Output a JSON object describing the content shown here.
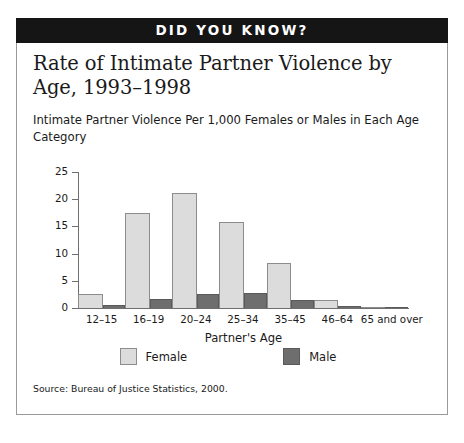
{
  "banner": {
    "label": "DID YOU KNOW?"
  },
  "title": "Rate of Intimate Partner Violence by Age, 1993–1998",
  "subtitle": "Intimate Partner Violence Per 1,000 Females or Males in Each Age Category",
  "source": "Source:  Bureau of Justice Statistics, 2000.",
  "legend": [
    {
      "label": "Female",
      "color": "#dcdcdc"
    },
    {
      "label": "Male",
      "color": "#6e6e6e"
    }
  ],
  "colors": {
    "female": "#dcdcdc",
    "male": "#6e6e6e",
    "banner_bg": "#151515",
    "banner_fg": "#ffffff",
    "axis": "#6f6f6f",
    "frame": "#9a9a9a",
    "text": "#1a1a1a"
  },
  "chart_data": {
    "type": "bar",
    "title": "Rate of Intimate Partner Violence by Age, 1993–1998",
    "subtitle": "Intimate Partner Violence Per 1,000 Females or Males in Each Age Category",
    "xlabel": "Partner's Age",
    "ylabel": "",
    "categories": [
      "12–15",
      "16–19",
      "20–24",
      "25–34",
      "35–45",
      "46–64",
      "65 and over"
    ],
    "series": [
      {
        "name": "Female",
        "color": "#dcdcdc",
        "values": [
          2.5,
          17.4,
          21.2,
          15.8,
          8.2,
          1.5,
          0.2
        ]
      },
      {
        "name": "Male",
        "color": "#6e6e6e",
        "values": [
          0.6,
          1.6,
          2.5,
          2.7,
          1.4,
          0.4,
          0.2
        ]
      }
    ],
    "ylim": [
      0,
      25
    ],
    "yticks": [
      0,
      5,
      10,
      15,
      20,
      25
    ],
    "ytick_labels": [
      "0",
      "5",
      "10",
      "15",
      "20",
      "25"
    ],
    "grid": false,
    "legend_position": "bottom"
  }
}
